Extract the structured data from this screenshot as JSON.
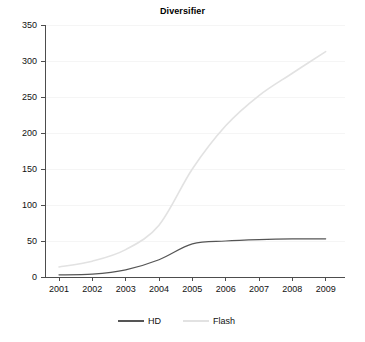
{
  "chart_data": {
    "type": "line",
    "title": "Diversifier",
    "xlabel": "",
    "ylabel": "",
    "x": [
      "2001",
      "2002",
      "2003",
      "2004",
      "2005",
      "2006",
      "2007",
      "2008",
      "2009"
    ],
    "categories": [
      "2001",
      "2002",
      "2003",
      "2004",
      "2005",
      "2006",
      "2007",
      "2008",
      "2009"
    ],
    "series": [
      {
        "name": "HD",
        "color": "#555555",
        "values": [
          3,
          4,
          10,
          24,
          46,
          50,
          52,
          53,
          53
        ]
      },
      {
        "name": "Flash",
        "color": "#e2e2e2",
        "values": [
          14,
          22,
          38,
          72,
          150,
          210,
          252,
          283,
          313
        ]
      }
    ],
    "ylim": [
      0,
      350
    ],
    "yticks": [
      0,
      50,
      100,
      150,
      200,
      250,
      300,
      350
    ],
    "ytick_labels": [
      "0",
      "50",
      "100",
      "150",
      "200",
      "250",
      "300",
      "350"
    ],
    "xtick_labels": [
      "2001",
      "2002",
      "2003",
      "2004",
      "2005",
      "2006",
      "2007",
      "2008",
      "2009"
    ],
    "grid": true,
    "grid_color": "#f2f2f2",
    "legend_position": "bottom",
    "legend": [
      {
        "label": "HD",
        "color": "#555555"
      },
      {
        "label": "Flash",
        "color": "#e2e2e2"
      }
    ],
    "axis_color": "#4d4d4d",
    "background": "#ffffff"
  }
}
